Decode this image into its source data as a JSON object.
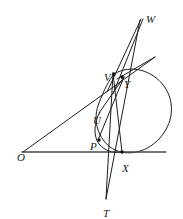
{
  "figure": {
    "width": 183,
    "height": 219,
    "background": "#ffffff",
    "ink_color": "#1d1d1d",
    "axis_color": "#4a4a4a"
  },
  "points": [
    {
      "id": "O",
      "label": "O",
      "x": 17,
      "y": 152,
      "mark_x": 23,
      "mark_y": 152,
      "dot": false
    },
    {
      "id": "W",
      "label": "W",
      "x": 146,
      "y": 14,
      "mark_x": 140,
      "mark_y": 20,
      "dot": false
    },
    {
      "id": "V",
      "label": "V",
      "x": 104,
      "y": 72,
      "mark_x": 114,
      "mark_y": 74,
      "dot": true
    },
    {
      "id": "Y",
      "label": "Y",
      "x": 124,
      "y": 79,
      "mark_x": 122,
      "mark_y": 77,
      "dot": true
    },
    {
      "id": "U",
      "label": "U",
      "x": 93,
      "y": 115,
      "mark_x": 100,
      "mark_y": 114,
      "dot": false
    },
    {
      "id": "P",
      "label": "P",
      "x": 90,
      "y": 141,
      "mark_x": 99,
      "mark_y": 140,
      "dot": true
    },
    {
      "id": "X",
      "label": "X",
      "x": 122,
      "y": 163,
      "mark_x": 122,
      "mark_y": 152,
      "dot": true
    },
    {
      "id": "T",
      "label": "T",
      "x": 103,
      "y": 208,
      "mark_x": 106,
      "mark_y": 199,
      "dot": false
    }
  ],
  "segments": [
    {
      "id": "baseline",
      "name": "horizontal-baseline",
      "from": [
        22,
        152
      ],
      "to": [
        166,
        152
      ]
    },
    {
      "id": "O-to-V",
      "name": "line-O-V-tangent",
      "from": [
        23,
        152
      ],
      "to": [
        155,
        57
      ]
    },
    {
      "id": "V-to-W",
      "name": "line-V-to-W",
      "from": [
        107,
        92
      ],
      "to": [
        141,
        19
      ]
    },
    {
      "id": "Y-to-W",
      "name": "line-Y-to-W",
      "from": [
        113,
        94
      ],
      "to": [
        143,
        19
      ]
    },
    {
      "id": "T-to-W",
      "name": "line-T-through-X-to-W",
      "from": [
        106,
        199
      ],
      "to": [
        140,
        20
      ]
    },
    {
      "id": "T-to-V",
      "name": "line-T-to-V",
      "from": [
        106,
        199
      ],
      "to": [
        113,
        73
      ]
    },
    {
      "id": "V-to-X",
      "name": "chord-V-to-X",
      "from": [
        113,
        73
      ],
      "to": [
        122,
        152
      ]
    },
    {
      "id": "U-to-Y",
      "name": "chord-U-to-Y",
      "from": [
        99,
        113
      ],
      "to": [
        124,
        77
      ]
    },
    {
      "id": "P-to-Y",
      "name": "chord-P-to-Y",
      "from": [
        98,
        140
      ],
      "to": [
        124,
        77
      ]
    }
  ],
  "conic": {
    "name": "tilted-ellipse",
    "path": "M 114,74 C 131,64 152,70 164,86 C 176,103 173,124 159,139 C 145,154 124,157 110,147 C 96,136 93,117 99,103 C 104,90 109,80 114,74 Z"
  },
  "inner_arc": {
    "name": "inner-conic-arc-U-P-X",
    "path": "M 100,112 C 94,122 93,136 99,144 C 105,151 114,154 123,152"
  },
  "tangent_stub": {
    "name": "tangent-at-Y",
    "from": [
      117,
      79
    ],
    "to": [
      155,
      57
    ]
  }
}
